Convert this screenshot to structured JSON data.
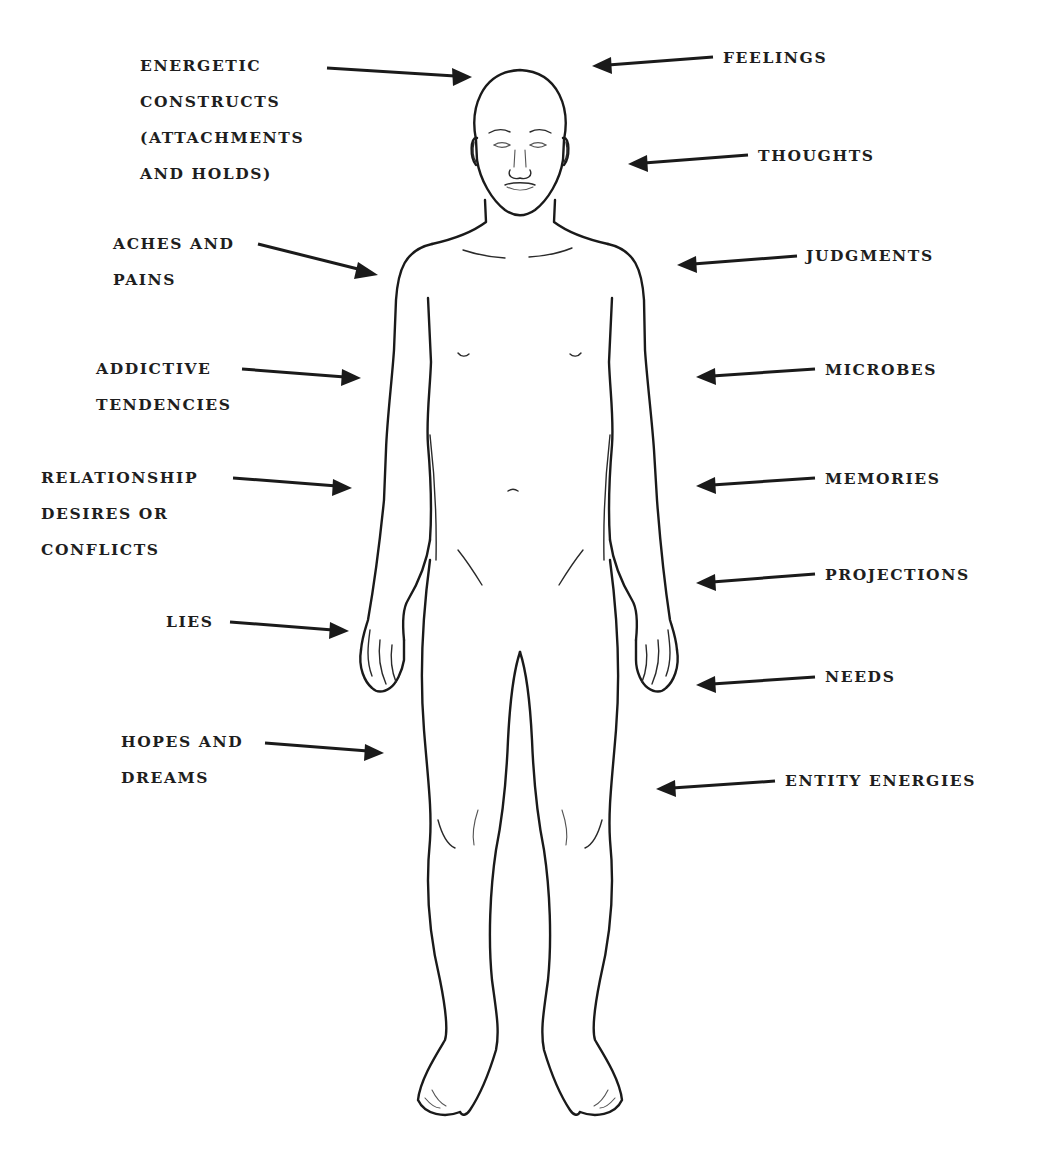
{
  "figure": {
    "type": "annotated body diagram",
    "colors": {
      "ink": "#1a1a1a",
      "background": "#ffffff"
    }
  },
  "labels_left": [
    {
      "id": "energetic-constructs",
      "lines": [
        "ENERGETIC",
        "CONSTRUCTS",
        "(ATTACHMENTS",
        "AND HOLDS)"
      ],
      "x": 140,
      "y": 48
    },
    {
      "id": "aches-and-pains",
      "lines": [
        "ACHES AND",
        "PAINS"
      ],
      "x": 113,
      "y": 228
    },
    {
      "id": "addictive-tendencies",
      "lines": [
        "ADDICTIVE",
        "TENDENCIES"
      ],
      "x": 96,
      "y": 351
    },
    {
      "id": "relationship-desires",
      "lines": [
        "RELATIONSHIP",
        "DESIRES OR",
        "CONFLICTS"
      ],
      "x": 41,
      "y": 460
    },
    {
      "id": "lies",
      "lines": [
        "LIES"
      ],
      "x": 166,
      "y": 604
    },
    {
      "id": "hopes-and-dreams",
      "lines": [
        "HOPES AND",
        "DREAMS"
      ],
      "x": 121,
      "y": 724
    }
  ],
  "labels_right": [
    {
      "id": "feelings",
      "lines": [
        "FEELINGS"
      ],
      "x": 723,
      "y": 40
    },
    {
      "id": "thoughts",
      "lines": [
        "THOUGHTS"
      ],
      "x": 758,
      "y": 138
    },
    {
      "id": "judgments",
      "lines": [
        "JUDGMENTS"
      ],
      "x": 806,
      "y": 238
    },
    {
      "id": "microbes",
      "lines": [
        "MICROBES"
      ],
      "x": 825,
      "y": 352
    },
    {
      "id": "memories",
      "lines": [
        "MEMORIES"
      ],
      "x": 825,
      "y": 461
    },
    {
      "id": "projections",
      "lines": [
        "PROJECTIONS"
      ],
      "x": 825,
      "y": 557
    },
    {
      "id": "needs",
      "lines": [
        "NEEDS"
      ],
      "x": 825,
      "y": 659
    },
    {
      "id": "entity-energies",
      "lines": [
        "ENTITY ENERGIES"
      ],
      "x": 785,
      "y": 763
    }
  ]
}
